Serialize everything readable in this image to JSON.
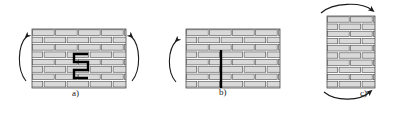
{
  "figure": {
    "background_color": "#ffffff",
    "brick_fill": "#d9d9d9",
    "brick_stroke": "#4d4d4d",
    "crack_color": "#000000",
    "arrow_color": "#1a1a1a",
    "panels": [
      {
        "id": "a",
        "label": "a)",
        "wall": {
          "x": 32,
          "y": 29,
          "width": 94,
          "height": 59,
          "rows": 8,
          "brick_width": 23
        },
        "crack": {
          "type": "stepped-diagonal",
          "description": "thick black zigzag staircase crack through middle of wall",
          "points": "88,54 74,54 74,62 88,62 88,70 74,70 74,78 88,78"
        },
        "arrows": [
          {
            "name": "rotation-arrow-left",
            "direction": "counterclockwise",
            "path": "M27,36 C17,46 17,70 26,81",
            "head_at": "start"
          },
          {
            "name": "rotation-arrow-right",
            "direction": "clockwise",
            "path": "M131,36 C141,46 141,70 132,81",
            "head_at": "start"
          }
        ]
      },
      {
        "id": "b",
        "label": "b)",
        "wall": {
          "x": 186,
          "y": 29,
          "width": 94,
          "height": 59,
          "rows": 8,
          "brick_width": 23
        },
        "crack": {
          "type": "vertical",
          "description": "thick black vertical crack from mid-height to base of wall",
          "x": 221,
          "y_start": 50,
          "y_end": 88
        },
        "arrows": [
          {
            "name": "rotation-arrow-left",
            "direction": "counterclockwise",
            "path": "M177,40 C167,50 167,72 176,82",
            "head_at": "start"
          }
        ]
      },
      {
        "id": "c",
        "label": "c)",
        "wall": {
          "x": 327,
          "y": 16,
          "width": 48,
          "height": 72,
          "rows": 10,
          "brick_width": 23
        },
        "crack": null,
        "arrows": [
          {
            "name": "rotation-arrow-top",
            "direction": "clockwise",
            "path": "M321,13 C333,2 362,2 372,10",
            "head_at": "end"
          },
          {
            "name": "rotation-arrow-bottom",
            "direction": "clockwise",
            "path": "M324,92 C336,102 360,101 370,92",
            "head_at": "end"
          }
        ]
      }
    ]
  }
}
